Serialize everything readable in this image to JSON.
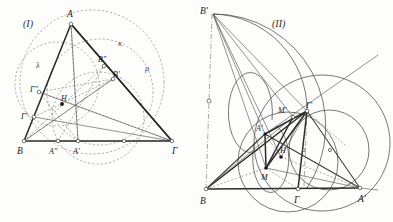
{
  "document": {
    "type": "geometry-figure-pair",
    "background_color": "#fdfdfc",
    "ink_color": "#2b2b2b",
    "construction_color": "#8d8d8d"
  },
  "figure_one": {
    "caption": "(I)",
    "description": "Triangle ABΓ with altitudes, orthocenter H, circumcircle κ and auxiliary circles λ and μ",
    "vertices": [
      {
        "name": "A",
        "label": "A",
        "x": 71,
        "y": 24
      },
      {
        "name": "B",
        "label": "B",
        "x": 24,
        "y": 141
      },
      {
        "name": "G",
        "label": "Γ",
        "x": 172,
        "y": 141
      }
    ],
    "points": [
      {
        "name": "H",
        "label": "H",
        "x": 62,
        "y": 104,
        "marker": "filled"
      },
      {
        "name": "A-prime",
        "label": "A'",
        "x": 78,
        "y": 141,
        "marker": "open"
      },
      {
        "name": "A-dprime",
        "label": "A''",
        "x": 58,
        "y": 141,
        "marker": "open"
      },
      {
        "name": "B-prime",
        "label": "B'",
        "x": 113,
        "y": 79,
        "marker": "open"
      },
      {
        "name": "B-dprime",
        "label": "B''",
        "x": 104,
        "y": 66,
        "marker": "open"
      },
      {
        "name": "G-prime",
        "label": "Γ'",
        "x": 34,
        "y": 117,
        "marker": "open"
      },
      {
        "name": "G-dprime",
        "label": "Γ''",
        "x": 39,
        "y": 92,
        "marker": "open"
      }
    ],
    "circles": [
      {
        "name": "kappa",
        "label": "κ",
        "cx": 92,
        "cy": 82,
        "r": 72,
        "style": "dashed"
      },
      {
        "name": "lambda",
        "label": "λ",
        "cx": 57,
        "cy": 84,
        "r": 42,
        "style": "dashed"
      },
      {
        "name": "mu",
        "label": "μ",
        "cx": 100,
        "cy": 92,
        "r": 53,
        "style": "dashed"
      }
    ],
    "greek_labels": [
      {
        "name": "kappa-label",
        "text": "κ",
        "x": 118,
        "y": 46
      },
      {
        "name": "lambda-label",
        "text": "λ",
        "x": 36,
        "y": 68
      },
      {
        "name": "mu-label",
        "text": "μ",
        "x": 145,
        "y": 71
      }
    ]
  },
  "figure_two": {
    "caption": "(II)",
    "description": "Triangle with reflected points, circumscribed arcs, orthocenter H and points M, M'",
    "vertices": [
      {
        "name": "B",
        "label": "B",
        "x": 206,
        "y": 189
      },
      {
        "name": "G",
        "label": "Γ",
        "x": 298,
        "y": 189
      },
      {
        "name": "A-prime-br",
        "label": "A'",
        "x": 360,
        "y": 188
      }
    ],
    "points": [
      {
        "name": "B-prime",
        "label": "B'",
        "x": 213,
        "y": 14
      },
      {
        "name": "G-prime",
        "label": "Γ'",
        "x": 307,
        "y": 111
      },
      {
        "name": "M-prime",
        "label": "M'",
        "x": 293,
        "y": 117
      },
      {
        "name": "A-prime",
        "label": "A'",
        "x": 265,
        "y": 134
      },
      {
        "name": "H",
        "label": "H",
        "x": 281,
        "y": 157,
        "marker": "filled"
      },
      {
        "name": "M",
        "label": "M",
        "x": 266,
        "y": 168,
        "marker": "filled"
      }
    ],
    "circles": [
      {
        "name": "big-arc-left",
        "cx": 258,
        "cy": 100,
        "r": 103
      },
      {
        "name": "lower-circle",
        "cx": 288,
        "cy": 160,
        "r": 52
      },
      {
        "name": "right-circle",
        "cx": 330,
        "cy": 150,
        "r": 42
      },
      {
        "name": "outer-right",
        "cx": 320,
        "cy": 140,
        "r": 70
      }
    ]
  }
}
